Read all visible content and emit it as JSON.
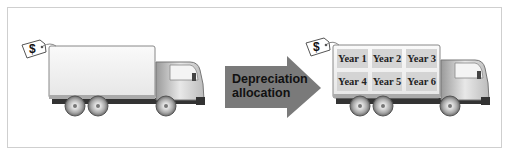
{
  "diagram": {
    "type": "illustration",
    "left_truck": {
      "price_tag_symbol": "$",
      "cargo_label": ""
    },
    "arrow": {
      "line1": "Depreciation",
      "line2": "allocation",
      "color": "#7a7a7a"
    },
    "right_truck": {
      "price_tag_symbol": "$",
      "years": [
        "Year 1",
        "Year 2",
        "Year 3",
        "Year 4",
        "Year 5",
        "Year 6"
      ]
    },
    "colors": {
      "frame_border": "#cfcfcf",
      "year_cell": "#d4d4d4",
      "truck_body": "#f2f2f2",
      "truck_shadow": "#555555"
    }
  }
}
